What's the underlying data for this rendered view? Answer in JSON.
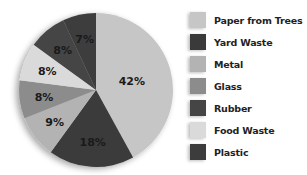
{
  "chart_data": {
    "type": "pie",
    "title": "",
    "start_angle": "12 o'clock",
    "direction": "clockwise",
    "legend_position": "right",
    "slices": [
      {
        "label": "Paper from Trees",
        "value": 42,
        "display": "42%",
        "color": "#c6c6c6"
      },
      {
        "label": "Yard Waste",
        "value": 18,
        "display": "18%",
        "color": "#3a3a3a"
      },
      {
        "label": "Metal",
        "value": 9,
        "display": "9%",
        "color": "#b3b3b3"
      },
      {
        "label": "Glass",
        "value": 8,
        "display": "8%",
        "color": "#8c8c8c"
      },
      {
        "label": "Food Waste",
        "value": 8,
        "display": "8%",
        "color": "#dadada"
      },
      {
        "label": "Rubber",
        "value": 8,
        "display": "8%",
        "color": "#454545"
      },
      {
        "label": "Plastic",
        "value": 7,
        "display": "7%",
        "color": "#3c3c3c"
      }
    ],
    "categories": [
      "Paper from Trees",
      "Yard Waste",
      "Metal",
      "Glass",
      "Food Waste",
      "Rubber",
      "Plastic"
    ],
    "values": [
      42,
      18,
      9,
      8,
      8,
      8,
      7
    ]
  },
  "legend": {
    "items": [
      {
        "label": "Paper from Trees",
        "color": "#c6c6c6"
      },
      {
        "label": "Yard Waste",
        "color": "#3a3a3a"
      },
      {
        "label": "Metal",
        "color": "#b3b3b3"
      },
      {
        "label": "Glass",
        "color": "#8c8c8c"
      },
      {
        "label": "Rubber",
        "color": "#454545"
      },
      {
        "label": "Food Waste",
        "color": "#dadada"
      },
      {
        "label": "Plastic",
        "color": "#3c3c3c"
      }
    ]
  }
}
